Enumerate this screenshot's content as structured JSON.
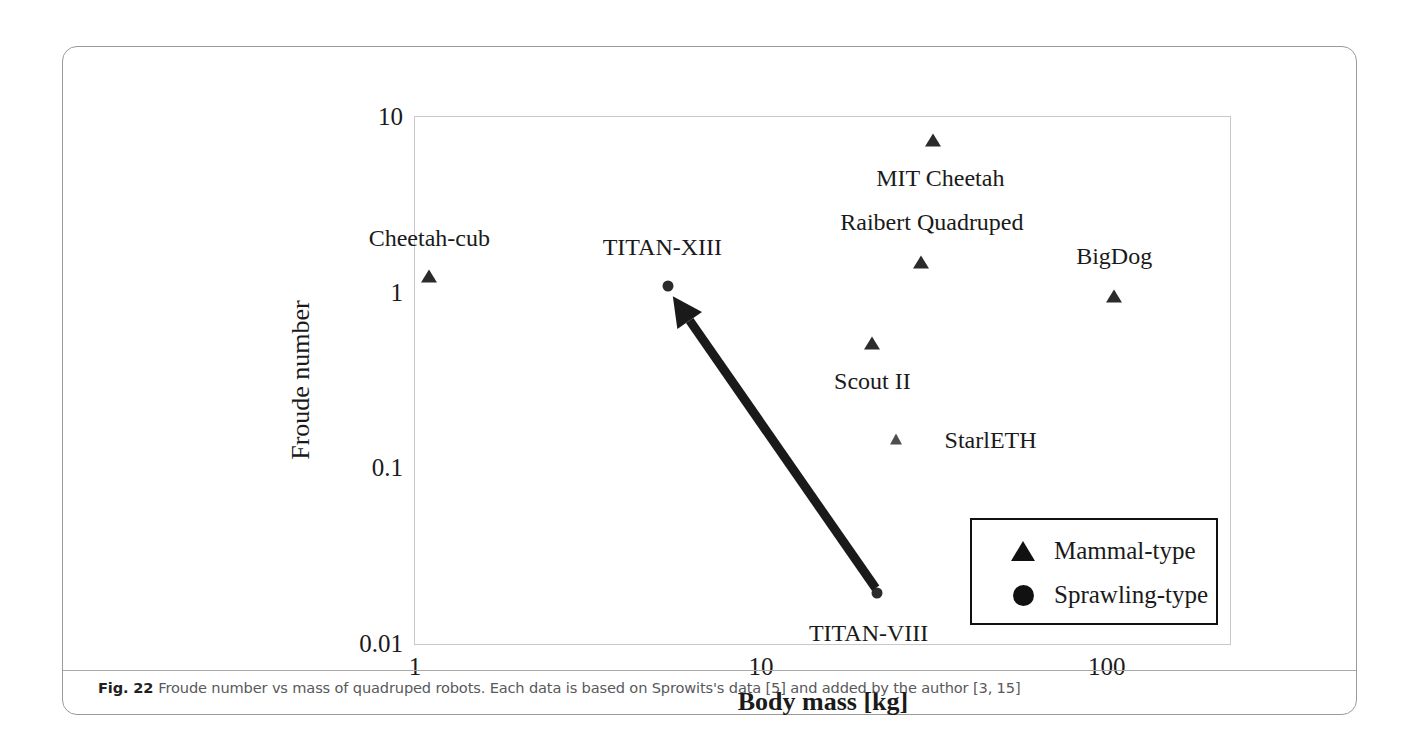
{
  "figure": {
    "caption_number": "Fig. 22",
    "caption_text": "Froude number vs mass of quadruped robots. Each data is based on Sprowits's data [5] and added by the author [3, 15]"
  },
  "chart_data": {
    "type": "scatter",
    "title": "",
    "xlabel": "Body mass [kg]",
    "ylabel": "Froude number",
    "xscale": "log",
    "yscale": "log",
    "xlim": [
      1,
      230
    ],
    "ylim": [
      0.01,
      10
    ],
    "xticks": [
      "1",
      "10",
      "100"
    ],
    "xtick_values": [
      1,
      10,
      100
    ],
    "yticks": [
      "10",
      "1",
      "0.1",
      "0.01"
    ],
    "ytick_values": [
      10,
      1,
      0.1,
      0.01
    ],
    "grid": false,
    "legend": {
      "position": "lower-right",
      "entries": [
        {
          "label": "Mammal-type",
          "marker": "triangle"
        },
        {
          "label": "Sprawling-type",
          "marker": "circle"
        }
      ]
    },
    "series": [
      {
        "name": "Mammal-type",
        "marker": "triangle",
        "points": [
          {
            "label": "Cheetah-cub",
            "x": 1.1,
            "y": 1.25,
            "label_dx": 0,
            "label_dy": -38
          },
          {
            "label": "MIT Cheetah",
            "x": 31.5,
            "y": 7.4,
            "label_dx": 7,
            "label_dy": 38
          },
          {
            "label": "Raibert Quadruped",
            "x": 29.0,
            "y": 1.5,
            "label_dx": 11,
            "label_dy": -40
          },
          {
            "label": "Scout II",
            "x": 21.0,
            "y": 0.52,
            "label_dx": 0,
            "label_dy": 38
          },
          {
            "label": "StarlETH",
            "x": 24.5,
            "y": 0.15,
            "label_dx": 95,
            "label_dy": 1
          },
          {
            "label": "BigDog",
            "x": 105,
            "y": 0.97,
            "label_dx": 0,
            "label_dy": -40
          }
        ]
      },
      {
        "name": "Sprawling-type",
        "marker": "circle",
        "points": [
          {
            "label": "TITAN-XIII",
            "x": 5.4,
            "y": 1.1,
            "label_dx": -6,
            "label_dy": -39
          },
          {
            "label": "TITAN-VIII",
            "x": 21.6,
            "y": 0.02,
            "label_dx": -8,
            "label_dy": 40
          }
        ]
      }
    ],
    "annotations": [
      {
        "name": "trend-arrow",
        "type": "arrow",
        "from": {
          "x": 21.6,
          "y": 0.021
        },
        "to": {
          "x": 5.6,
          "y": 0.95
        },
        "color": "#1a1a1a"
      }
    ]
  }
}
